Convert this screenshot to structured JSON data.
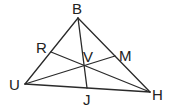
{
  "diagram": {
    "type": "triangle-with-cevians",
    "stroke_color": "#2a2a2a",
    "label_color": "#222222",
    "background": "#ffffff",
    "points": {
      "B": {
        "x": 78,
        "y": 18,
        "label": "B",
        "lx": 72,
        "ly": 14
      },
      "U": {
        "x": 25,
        "y": 84,
        "label": "U",
        "lx": 9,
        "ly": 90
      },
      "H": {
        "x": 150,
        "y": 92,
        "label": "H",
        "lx": 152,
        "ly": 100
      },
      "R": {
        "x": 51,
        "y": 52,
        "label": "R",
        "lx": 36,
        "ly": 53
      },
      "M": {
        "x": 115,
        "y": 56,
        "label": "M",
        "lx": 119,
        "ly": 61
      },
      "J": {
        "x": 87,
        "y": 88,
        "label": "J",
        "lx": 83,
        "ly": 105
      },
      "V": {
        "x": 85,
        "y": 65,
        "label": "V",
        "lx": 83,
        "ly": 62
      }
    },
    "segments": [
      [
        "B",
        "U"
      ],
      [
        "B",
        "H"
      ],
      [
        "U",
        "H"
      ],
      [
        "B",
        "J"
      ],
      [
        "U",
        "M"
      ],
      [
        "R",
        "H"
      ]
    ]
  }
}
